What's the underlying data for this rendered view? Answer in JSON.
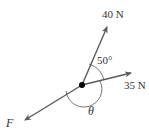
{
  "diagram": {
    "type": "force-vector-diagram",
    "colors": {
      "vector": "#5a5a5a",
      "arc": "#666666",
      "point": "#000000",
      "text": "#333333"
    },
    "vectors": [
      {
        "id": "force-40",
        "label": "40 N",
        "magnitude_text": "40 N"
      },
      {
        "id": "force-35",
        "label": "35 N",
        "magnitude_text": "35 N"
      },
      {
        "id": "force-F",
        "label": "F"
      }
    ],
    "angles": [
      {
        "id": "angle-between-40-35",
        "label": "50°"
      },
      {
        "id": "angle-theta",
        "label": "θ"
      }
    ]
  }
}
